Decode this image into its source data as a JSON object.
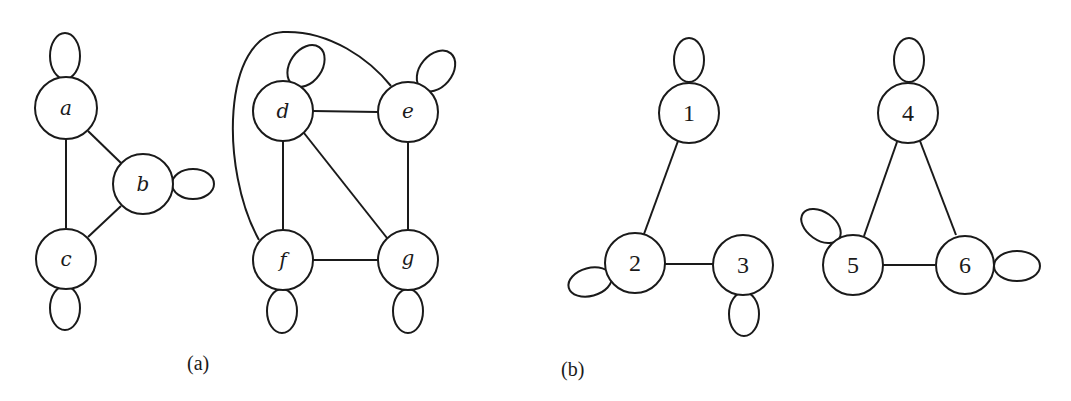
{
  "figure": {
    "panels": [
      {
        "caption": "(a)",
        "graphs": [
          {
            "nodes": [
              {
                "id": "a",
                "label": "a",
                "x": 66,
                "y": 108,
                "loop": "top"
              },
              {
                "id": "b",
                "label": "b",
                "x": 143,
                "y": 184,
                "loop": "right"
              },
              {
                "id": "c",
                "label": "c",
                "x": 66,
                "y": 259,
                "loop": "bottom"
              }
            ],
            "edges": [
              [
                "a",
                "b"
              ],
              [
                "a",
                "c"
              ],
              [
                "b",
                "c"
              ]
            ]
          },
          {
            "nodes": [
              {
                "id": "d",
                "label": "d",
                "x": 283,
                "y": 111,
                "loop": "top-right"
              },
              {
                "id": "e",
                "label": "e",
                "x": 408,
                "y": 112,
                "loop": "top-right"
              },
              {
                "id": "f",
                "label": "f",
                "x": 283,
                "y": 260,
                "loop": "bottom"
              },
              {
                "id": "g",
                "label": "g",
                "x": 408,
                "y": 260,
                "loop": "bottom"
              }
            ],
            "edges": [
              [
                "d",
                "e"
              ],
              [
                "d",
                "f"
              ],
              [
                "d",
                "g"
              ],
              [
                "e",
                "g"
              ],
              [
                "f",
                "g"
              ],
              [
                "f",
                "e"
              ]
            ]
          }
        ]
      },
      {
        "caption": "(b)",
        "graphs": [
          {
            "nodes": [
              {
                "id": "1",
                "label": "1",
                "x": 689,
                "y": 113,
                "loop": "top"
              },
              {
                "id": "2",
                "label": "2",
                "x": 635,
                "y": 263,
                "loop": "left"
              },
              {
                "id": "3",
                "label": "3",
                "x": 743,
                "y": 265,
                "loop": "bottom"
              }
            ],
            "edges": [
              [
                "1",
                "2"
              ],
              [
                "2",
                "3"
              ]
            ]
          },
          {
            "nodes": [
              {
                "id": "4",
                "label": "4",
                "x": 908,
                "y": 113,
                "loop": "top"
              },
              {
                "id": "5",
                "label": "5",
                "x": 853,
                "y": 265,
                "loop": "top-left"
              },
              {
                "id": "6",
                "label": "6",
                "x": 965,
                "y": 265,
                "loop": "right"
              }
            ],
            "edges": [
              [
                "4",
                "5"
              ],
              [
                "4",
                "6"
              ],
              [
                "5",
                "6"
              ]
            ]
          }
        ]
      }
    ]
  },
  "labels": {
    "a": "a",
    "b": "b",
    "c": "c",
    "d": "d",
    "e": "e",
    "f": "f",
    "g": "g",
    "n1": "1",
    "n2": "2",
    "n3": "3",
    "n4": "4",
    "n5": "5",
    "n6": "6",
    "caption_a": "(a)",
    "caption_b": "(b)"
  }
}
